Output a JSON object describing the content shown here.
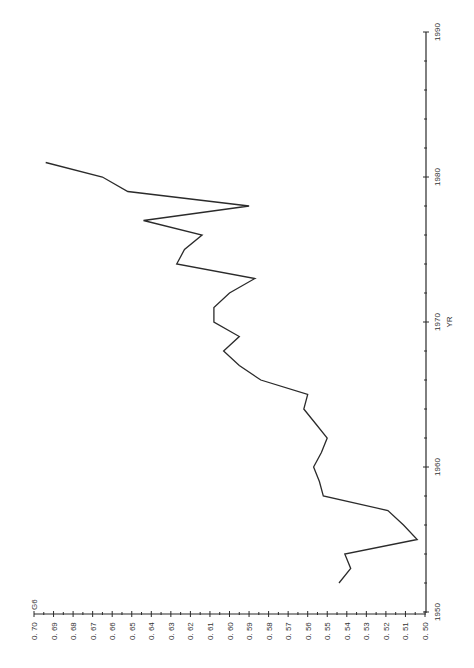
{
  "chart_data": {
    "type": "line",
    "orientation": "rotated-90-ccw",
    "title": "",
    "xlabel": "YR",
    "ylabel": "G6",
    "xlim": [
      1950,
      1990
    ],
    "ylim": [
      0.5,
      0.7
    ],
    "x_ticks": [
      1950,
      1960,
      1970,
      1980,
      1990
    ],
    "x_tick_labels": [
      "1950",
      "1960",
      "1970",
      "1980",
      "1990"
    ],
    "y_ticks": [
      0.7,
      0.69,
      0.68,
      0.67,
      0.66,
      0.65,
      0.64,
      0.63,
      0.62,
      0.61,
      0.6,
      0.59,
      0.58,
      0.57,
      0.56,
      0.55,
      0.54,
      0.53,
      0.52,
      0.51,
      0.5
    ],
    "y_tick_labels": [
      "0.70",
      "0.69",
      "0.68",
      "0.67",
      "0.66",
      "0.65",
      "0.64",
      "0.63",
      "0.62",
      "0.61",
      "0.60",
      "0.59",
      "0.58",
      "0.57",
      "0.56",
      "0.55",
      "0.54",
      "0.53",
      "0.52",
      "0.51",
      "0.50"
    ],
    "grid": false,
    "legend": null,
    "series": [
      {
        "name": "G6",
        "x": [
          1952,
          1953,
          1954,
          1955,
          1956,
          1957,
          1958,
          1959,
          1960,
          1961,
          1962,
          1963,
          1964,
          1965,
          1966,
          1967,
          1968,
          1969,
          1970,
          1971,
          1972,
          1973,
          1974,
          1975,
          1976,
          1977,
          1978,
          1979,
          1980,
          1981
        ],
        "values": [
          0.544,
          0.538,
          0.541,
          0.504,
          0.511,
          0.519,
          0.552,
          0.554,
          0.557,
          0.553,
          0.55,
          0.556,
          0.562,
          0.56,
          0.584,
          0.595,
          0.603,
          0.595,
          0.608,
          0.608,
          0.6,
          0.587,
          0.627,
          0.623,
          0.614,
          0.644,
          0.59,
          0.652,
          0.665,
          0.694
        ]
      }
    ]
  },
  "layout": {
    "g6_axis": {
      "y": 614,
      "x_at_070": 34,
      "x_at_050": 425
    },
    "yr_axis": {
      "x": 426,
      "y_at_1950": 612,
      "y_at_1990": 32
    },
    "line_color": "#2b2b2b",
    "axis_color": "#2a2a2a"
  },
  "labels": {
    "g6_axis_title": "G6",
    "yr_axis_title": "YR"
  }
}
